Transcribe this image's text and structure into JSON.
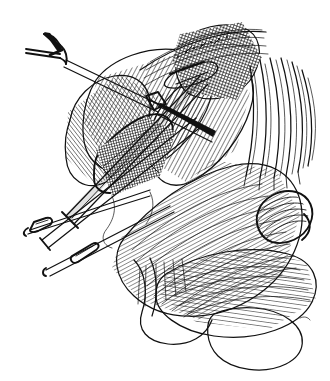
{
  "figure": {
    "medium": "pen-and-ink line drawing",
    "caption": "",
    "background_color": "#ffffff",
    "ink_color": "#111111",
    "width": 330,
    "height": 381
  },
  "instruments": [
    {
      "name": "two-prong skin hook retractor",
      "position": "upper-left",
      "description": "double-pronged retractor with forked tip angled up-left"
    },
    {
      "name": "retractor shaft",
      "position": "upper-left to center",
      "description": "long slender shaft running diagonally down-right into the wound"
    },
    {
      "name": "elevator probe",
      "position": "center-left diagonal",
      "description": "broad flat blade crossing the field from lower-left to upper-right"
    },
    {
      "name": "loop-handled probe upper",
      "position": "lower-left",
      "description": "slim shaft terminating in an elongated closed loop"
    },
    {
      "name": "loop-handled probe lower",
      "position": "lower-left",
      "description": "second slim shaft with elongated closed loop end"
    }
  ],
  "anatomy": [
    {
      "name": "muscle belly superior",
      "shading": "dense parallel line hatching",
      "position": "upper-center-left"
    },
    {
      "name": "tendon band",
      "shading": "cross-hatched dark",
      "position": "center"
    },
    {
      "name": "nerve / vessel bundle",
      "shading": "heavy cross-hatch",
      "position": "upper-right"
    },
    {
      "name": "fibrous strands",
      "shading": "vertical line strokes",
      "position": "right margin"
    },
    {
      "name": "thenar eminence",
      "shading": "contour line hatching",
      "position": "lower-center-right"
    },
    {
      "name": "thumb with nail",
      "shading": "curved contour hatching",
      "position": "lower-right"
    },
    {
      "name": "finger pulp",
      "shading": "outline only",
      "position": "bottom-right"
    },
    {
      "name": "retracted skin flap",
      "shading": "outline with short strokes",
      "position": "bottom-center"
    }
  ]
}
